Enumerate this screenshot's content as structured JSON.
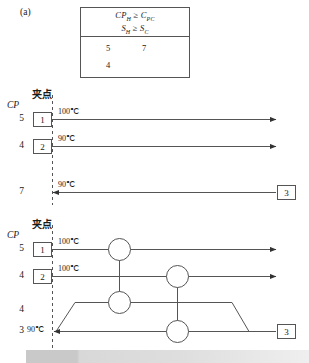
{
  "figure": {
    "label": "(a)",
    "criterion_table": {
      "header_lines": [
        {
          "text": "CP",
          "sub1": "H",
          "rel": " ≥ ",
          "text2": "C",
          "sub2": "PC"
        },
        {
          "text": "S",
          "sub1": "H",
          "rel": " ≥ ",
          "text2": "S",
          "sub2": "C"
        }
      ],
      "header_line_1": "CPH ≥ CPC",
      "header_line_2": "SH ≥ SC",
      "values": {
        "row1_col1": "5",
        "row1_col2": "7",
        "row2_col1": "4"
      }
    },
    "pinch_label": "夹点",
    "cp_header": "CP",
    "degree": "℃",
    "top_grid": {
      "title_cp": "CP",
      "pinch_label": "夹点",
      "streams": [
        {
          "cp": "5",
          "box": "1",
          "temp": "100℃",
          "direction": "right"
        },
        {
          "cp": "4",
          "box": "2",
          "temp": "90℃",
          "direction": "right"
        },
        {
          "cp": "7",
          "box": "3",
          "temp": "90℃",
          "direction": "left"
        }
      ]
    },
    "bottom_grid": {
      "title_cp": "CP",
      "pinch_label": "夹点",
      "streams": [
        {
          "cp": "5",
          "box": "1",
          "temp": "100℃",
          "direction": "right"
        },
        {
          "cp": "4",
          "box": "2",
          "temp": "100℃",
          "direction": "right"
        },
        {
          "cp": "4",
          "box": "",
          "temp": "",
          "direction": "left"
        },
        {
          "cp": "3",
          "box": "3",
          "temp": "90℃",
          "direction": "left"
        }
      ],
      "exchangers": [
        {
          "name": "hx-a-hot",
          "row": 1
        },
        {
          "name": "hx-a-cold",
          "row": 3
        },
        {
          "name": "hx-b-hot",
          "row": 2
        },
        {
          "name": "hx-b-cold",
          "row": 4
        }
      ]
    }
  },
  "colors": {
    "line": "#555555",
    "text": "#1a1a1a",
    "dash": "#777777",
    "box_border": "#555555"
  }
}
